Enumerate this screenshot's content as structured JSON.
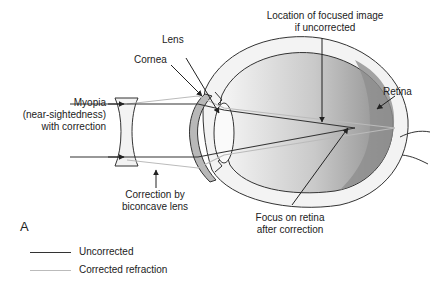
{
  "figure": {
    "panel_label": "A"
  },
  "labels": {
    "lens": "Lens",
    "cornea": "Cornea",
    "myopia_line1": "Myopia",
    "myopia_line2": "(near-sightedness)",
    "myopia_line3": "with correction",
    "focused_line1": "Location of focused image",
    "focused_line2": "if uncorrected",
    "retina": "Retina",
    "correction_line1": "Correction by",
    "correction_line2": "biconcave lens",
    "focus_line1": "Focus on retina",
    "focus_line2": "after correction"
  },
  "legend": {
    "items": [
      {
        "label": "Uncorrected",
        "color": "#333333"
      },
      {
        "label": "Corrected refraction",
        "color": "#bbbbbb"
      }
    ]
  },
  "colors": {
    "outline": "#333333",
    "sclera": "#f2f2f2",
    "vitreous_light": "#f4f4f4",
    "vitreous_dark": "#8a8a8a",
    "cornea_fill": "#b5b5b5"
  }
}
